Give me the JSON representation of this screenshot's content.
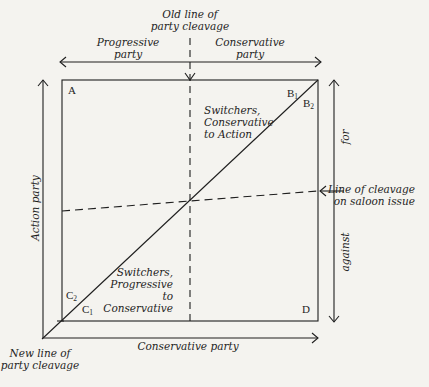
{
  "diagram": {
    "old_line_label": [
      "Old line of",
      "party cleavage"
    ],
    "top_left_party": [
      "Progressive",
      "party"
    ],
    "top_right_party": [
      "Conservative",
      "party"
    ],
    "left_axis_label": "Action party",
    "bottom_axis_label": "Conservative party",
    "right_axis_for": "for",
    "right_axis_against": "against",
    "saloon_label": [
      "Line of cleavage",
      "on saloon issue"
    ],
    "new_line_label": [
      "New line of",
      "party cleavage"
    ],
    "switchers_top": [
      "Switchers,",
      "Conservative",
      "to Action"
    ],
    "switchers_bottom": [
      "Switchers,",
      "Progressive",
      "to",
      "Conservative"
    ],
    "corner_A": "A",
    "corner_D": "D",
    "corner_B": "B",
    "corner_C": "C",
    "sub_1": "1",
    "sub_2": "2",
    "colors": {
      "ink": "#1e1e1e",
      "paper": "#f4f3ef"
    }
  }
}
